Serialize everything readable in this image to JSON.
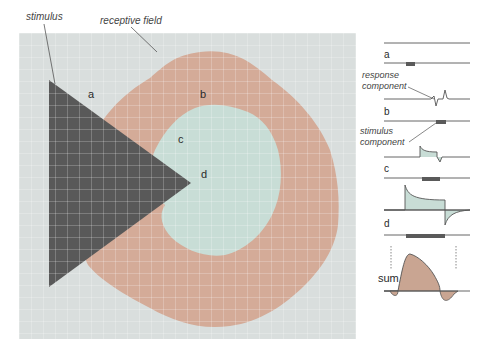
{
  "figure": {
    "callouts": {
      "stimulus": "stimulus",
      "receptive_field": "receptive field",
      "response_component": [
        "response",
        "component"
      ],
      "stimulus_component": [
        "stimulus",
        "component"
      ]
    },
    "region_labels": {
      "a": "a",
      "b": "b",
      "c": "c",
      "d": "d"
    },
    "trace_labels": {
      "a": "a",
      "b": "b",
      "c": "c",
      "d": "d",
      "sum": "sum"
    },
    "colors": {
      "grid_background": "#d9dedd",
      "grid_line": "#bfc6c8",
      "receptive_field_surround": "#d4ab98",
      "receptive_field_center": "#c8ddd6",
      "stimulus": "#595959",
      "stimulus_bar": "#5a5a5a",
      "trace_line": "#555555",
      "sum_fill": "#c9a592"
    }
  }
}
